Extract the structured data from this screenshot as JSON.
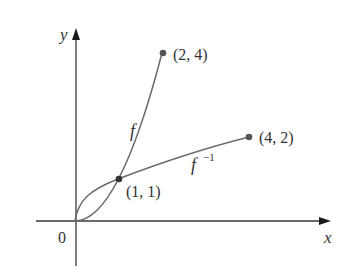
{
  "diagram": {
    "type": "function-and-inverse-graph",
    "axes": {
      "x_label": "x",
      "y_label": "y",
      "origin_label": "0"
    },
    "curves": [
      {
        "name": "f",
        "label": "f",
        "expression": "x^2",
        "domain": [
          0,
          2
        ]
      },
      {
        "name": "f_inverse",
        "label": "f",
        "label_superscript": "−1",
        "expression": "sqrt(x)",
        "domain": [
          0,
          4
        ]
      }
    ],
    "points": [
      {
        "label": "(2, 4)",
        "x": 2,
        "y": 4
      },
      {
        "label": "(4, 2)",
        "x": 4,
        "y": 2
      },
      {
        "label": "(1, 1)",
        "x": 1,
        "y": 1
      }
    ],
    "colors": {
      "axis": "#3a3a3a",
      "curve": "#6b6b6b",
      "point": "#555555",
      "text": "#333333"
    }
  }
}
